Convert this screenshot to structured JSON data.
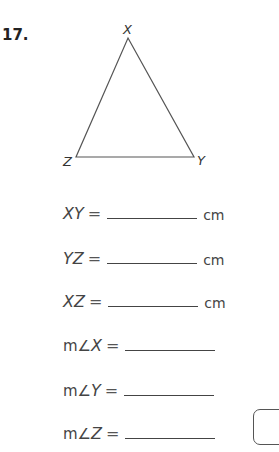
{
  "problem": {
    "number": "17."
  },
  "triangle": {
    "vertices": [
      {
        "name": "X",
        "x": 128,
        "y": 38
      },
      {
        "name": "Y",
        "x": 194,
        "y": 157
      },
      {
        "name": "Z",
        "x": 76,
        "y": 157
      }
    ],
    "labels": {
      "x": "X",
      "y": "Y",
      "z": "Z"
    }
  },
  "measurements": [
    {
      "prefix": "",
      "label": "XY",
      "equals": "=",
      "value": "",
      "unit": "cm"
    },
    {
      "prefix": "",
      "label": "YZ",
      "equals": "=",
      "value": "",
      "unit": "cm"
    },
    {
      "prefix": "",
      "label": "XZ",
      "equals": "=",
      "value": "",
      "unit": "cm"
    },
    {
      "prefix": "m∠",
      "label": "X",
      "equals": "=",
      "value": "",
      "unit": ""
    },
    {
      "prefix": "m∠",
      "label": "Y",
      "equals": "=",
      "value": "",
      "unit": ""
    },
    {
      "prefix": "m∠",
      "label": "Z",
      "equals": "=",
      "value": "",
      "unit": ""
    }
  ]
}
